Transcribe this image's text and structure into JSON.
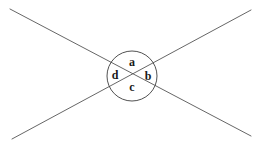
{
  "figure": {
    "name": "intersecting-lines-angle-diagram",
    "background_color": "#ffffff",
    "stroke_color": "#555555",
    "circle_stroke_color": "#3d3d3d",
    "label_color": "#1a1a1a",
    "canvas": {
      "width": 264,
      "height": 149
    }
  },
  "lines": [
    {
      "name": "line-top-left-to-bottom-right",
      "x1": 10,
      "y1": 9,
      "x2": 251,
      "y2": 136,
      "stroke_width": 0.9
    },
    {
      "name": "line-bottom-left-to-top-right",
      "x1": 12,
      "y1": 139,
      "x2": 251,
      "y2": 10,
      "stroke_width": 0.9
    }
  ],
  "circle": {
    "name": "angle-circle",
    "cx": 132,
    "cy": 76,
    "r": 25,
    "stroke_width": 0.9
  },
  "intersection_point": {
    "name": "lines-intersection",
    "x": 131,
    "y": 77
  },
  "labels": [
    {
      "id": "a",
      "text": "a",
      "position": "top",
      "x": 132,
      "y": 63
    },
    {
      "id": "b",
      "text": "b",
      "position": "right",
      "x": 148,
      "y": 77
    },
    {
      "id": "c",
      "text": "c",
      "position": "bottom",
      "x": 132,
      "y": 88
    },
    {
      "id": "d",
      "text": "d",
      "position": "left",
      "x": 115,
      "y": 76
    }
  ]
}
